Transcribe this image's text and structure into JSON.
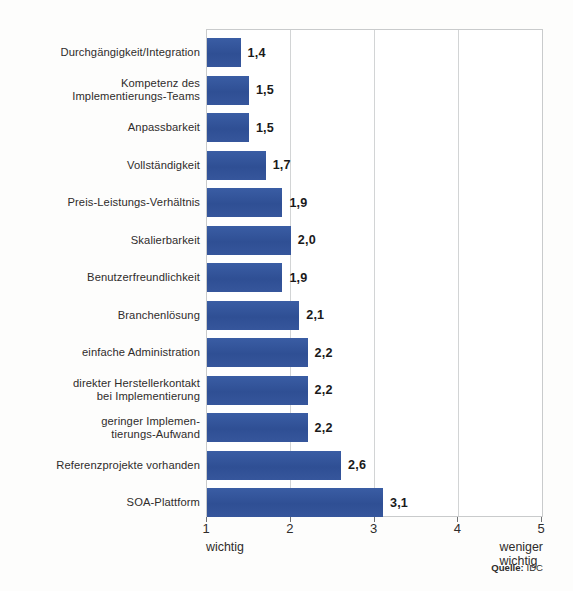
{
  "chart_data": {
    "type": "bar",
    "orientation": "horizontal",
    "title": "",
    "xlabel": "",
    "ylabel": "",
    "xlim": [
      1,
      5
    ],
    "xticks": [
      "1",
      "2",
      "3",
      "4",
      "5"
    ],
    "grid": true,
    "legend": null,
    "axis_end_labels": {
      "left": "wichtig",
      "right": "weniger wichtig"
    },
    "source": {
      "prefix": "Quelle:",
      "value": "IDC"
    },
    "bar_color": "#33549b",
    "categories": [
      "Durchgängigkeit/Integration",
      "Kompetenz des\nImplementierungs-Teams",
      "Anpassbarkeit",
      "Vollständigkeit",
      "Preis-Leistungs-Verhältnis",
      "Skalierbarkeit",
      "Benutzerfreundlichkeit",
      "Branchenlösung",
      "einfache Administration",
      "direkter Herstellerkontakt\nbei Implementierung",
      "geringer Implemen-\ntierungs-Aufwand",
      "Referenzprojekte vorhanden",
      "SOA-Plattform"
    ],
    "values": [
      1.4,
      1.5,
      1.5,
      1.7,
      1.9,
      2.0,
      1.9,
      2.1,
      2.2,
      2.2,
      2.2,
      2.6,
      3.1
    ],
    "value_labels": [
      "1,4",
      "1,5",
      "1,5",
      "1,7",
      "1,9",
      "2,0",
      "1,9",
      "2,1",
      "2,2",
      "2,2",
      "2,2",
      "2,6",
      "3,1"
    ]
  }
}
